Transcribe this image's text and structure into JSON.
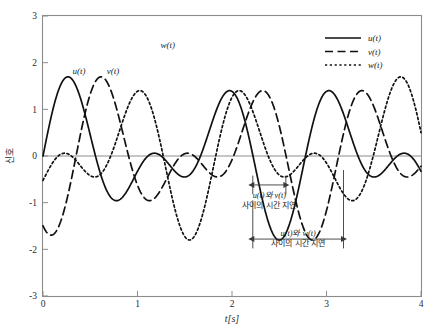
{
  "chart_data": {
    "type": "line",
    "title": "",
    "subtitle": "",
    "xlabel": "t[s]",
    "ylabel": "신호",
    "xlim": [
      0,
      4
    ],
    "ylim": [
      -3,
      3
    ],
    "xticks": [
      "0",
      "1",
      "2",
      "3",
      "4"
    ],
    "xtick_values": [
      0,
      1,
      2,
      3,
      4
    ],
    "yticks": [
      "-3",
      "-2",
      "-1",
      "0",
      "1",
      "2",
      "3"
    ],
    "ytick_values": [
      -3,
      -2,
      -1,
      0,
      1,
      2,
      3
    ],
    "grid": false,
    "legend_position": "top-right",
    "zero_line": true,
    "x": [
      0,
      0.05,
      0.1,
      0.15,
      0.2,
      0.25,
      0.3,
      0.35,
      0.4,
      0.45,
      0.5,
      0.55,
      0.6,
      0.65,
      0.7,
      0.75,
      0.8,
      0.85,
      0.9,
      0.95,
      1.0,
      1.05,
      1.1,
      1.15,
      1.2,
      1.25,
      1.3,
      1.35,
      1.4,
      1.45,
      1.5,
      1.55,
      1.6,
      1.65,
      1.7,
      1.75,
      1.8,
      1.85,
      1.9,
      1.95,
      2.0,
      2.05,
      2.1,
      2.15,
      2.2,
      2.25,
      2.3,
      2.35,
      2.4,
      2.45,
      2.5,
      2.55,
      2.6,
      2.65,
      2.7,
      2.75,
      2.8,
      2.85,
      2.9,
      2.95,
      3.0,
      3.05,
      3.1,
      3.15,
      3.2,
      3.25,
      3.3,
      3.35,
      3.4,
      3.45,
      3.5,
      3.55,
      3.6,
      3.65,
      3.7,
      3.75,
      3.8,
      3.85,
      3.9,
      3.95,
      4.0
    ],
    "series": [
      {
        "name": "u(t)",
        "label": "u(t)",
        "style": "solid",
        "color": "#111111",
        "formula": "0.9*sin(2*pi*0.70*t) + 0.9*sin(2*pi*1.10*t)",
        "peaks": [
          {
            "t": 0.35,
            "value": 1.35
          },
          {
            "t": 1.55,
            "value": 2.0
          },
          {
            "t": 2.8,
            "value": 1.35
          }
        ],
        "troughs": [
          {
            "t": 1.0,
            "value": -0.2
          },
          {
            "t": 2.2,
            "value": -0.2
          },
          {
            "t": 3.4,
            "value": -1.3
          }
        ],
        "start_value": 0.0,
        "end_value": 0.3
      },
      {
        "name": "v(t)",
        "label": "v(t)",
        "style": "dashed",
        "color": "#111111",
        "formula": "u(t - 0.35) (time-shifted)",
        "time_shift": 0.35,
        "peaks": [
          {
            "t": 0.7,
            "value": 1.35
          },
          {
            "t": 1.9,
            "value": 2.0
          },
          {
            "t": 3.15,
            "value": 1.35
          },
          {
            "t": 3.8,
            "value": 0.75
          }
        ],
        "troughs": [
          {
            "t": 1.35,
            "value": -0.2
          },
          {
            "t": 2.55,
            "value": -0.2
          },
          {
            "t": 3.75,
            "value": -1.3
          }
        ],
        "start_value": -1.4,
        "end_value": -0.9
      },
      {
        "name": "w(t)",
        "label": "w(t)",
        "style": "dotted",
        "color": "#111111",
        "formula": "u(t + 0.95) (time-shifted)",
        "time_shift": -0.95,
        "peaks": [
          {
            "t": 0.05,
            "value": 0.72
          },
          {
            "t": 1.35,
            "value": 1.95
          },
          {
            "t": 2.55,
            "value": 1.8
          },
          {
            "t": 3.8,
            "value": 0.75
          }
        ],
        "troughs": [
          {
            "t": 0.75,
            "value": -0.78
          },
          {
            "t": 1.95,
            "value": 0.08
          },
          {
            "t": 3.2,
            "value": -0.7
          }
        ],
        "start_value": 0.7,
        "end_value": 0.55
      }
    ],
    "curve_labels": [
      {
        "text": "u(t)",
        "t": 0.38,
        "value": 1.75
      },
      {
        "text": "v(t)",
        "t": 0.74,
        "value": 1.75
      },
      {
        "text": "w(t)",
        "t": 1.32,
        "value": 2.32
      }
    ],
    "annotations": [
      {
        "id": "delay-u-v",
        "line1": "u(t)와 v(t)",
        "line2": "사이의 시간 지연",
        "t_start": 2.22,
        "t_end": 2.57,
        "delay": 0.35,
        "arrow_y": -0.62
      },
      {
        "id": "delay-u-w",
        "line1": "u(t)와 w(t)",
        "line2": "사이의 시간 지연",
        "t_start": 2.22,
        "t_end": 3.18,
        "delay": 0.96,
        "arrow_y": -1.78
      }
    ],
    "legend": [
      {
        "label": "u(t)",
        "style": "solid"
      },
      {
        "label": "v(t)",
        "style": "dashed"
      },
      {
        "label": "w(t)",
        "style": "dotted"
      }
    ]
  }
}
